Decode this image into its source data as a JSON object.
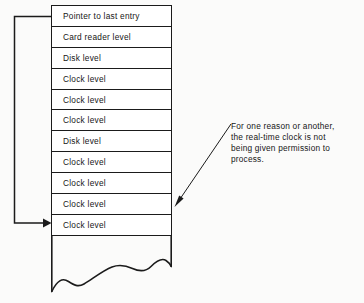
{
  "diagram": {
    "colors": {
      "stroke": "#1b1b1b",
      "text": "#161616",
      "cell_fill": "#ffffff",
      "background": "#fbfbfa"
    },
    "stack": {
      "name": "interrupt-stack",
      "rows": [
        {
          "label": "Pointer to last entry"
        },
        {
          "label": "Card reader level"
        },
        {
          "label": "Disk level"
        },
        {
          "label": "Clock level"
        },
        {
          "label": "Clock level"
        },
        {
          "label": "Clock level"
        },
        {
          "label": "Disk level"
        },
        {
          "label": "Clock level"
        },
        {
          "label": "Clock level"
        },
        {
          "label": "Clock level"
        },
        {
          "label": "Clock level"
        }
      ],
      "bottom_edge": "torn-wavy-edge"
    },
    "pointer_arrow": {
      "name": "pointer-to-last-entry-arrow",
      "from_row_index": 0,
      "to_row_index": 10,
      "direction": "left-around-and-right"
    },
    "callout": {
      "name": "real-time-clock-callout",
      "target_row_index": 9,
      "lines": [
        "For one reason or another,",
        "the real-time clock is not",
        "being given permission to",
        "process."
      ]
    }
  }
}
